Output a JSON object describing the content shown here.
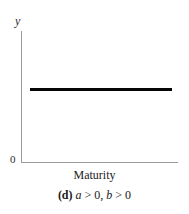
{
  "figure": {
    "panel_id": "(d)",
    "axes": {
      "y_label": "y",
      "x_label": "Maturity",
      "origin_label": "0",
      "axis_color": "#9a9a9a"
    },
    "curve": {
      "color": "#050505",
      "description": "flat horizontal line"
    },
    "caption": {
      "panel": "(d)",
      "term_a": "a",
      "rel_a": " > ",
      "val_a": "0",
      "separator": ", ",
      "term_b": "b",
      "rel_b": " > ",
      "val_b": "0"
    }
  },
  "chart_data": {
    "type": "line",
    "title": "",
    "subtitle": "(d) a > 0, b > 0",
    "xlabel": "Maturity",
    "ylabel": "y",
    "xlim": [
      0,
      1
    ],
    "ylim": [
      0,
      1
    ],
    "grid": false,
    "legend": null,
    "x": [
      0.06,
      0.2,
      0.4,
      0.6,
      0.8,
      0.96
    ],
    "series": [
      {
        "name": "yield curve",
        "values": [
          0.56,
          0.56,
          0.56,
          0.56,
          0.56,
          0.56
        ],
        "color": "#050505",
        "linewidth": 3
      }
    ],
    "annotations": [
      "0"
    ],
    "tick_labels": {
      "x": [],
      "y": [
        "0"
      ]
    }
  }
}
